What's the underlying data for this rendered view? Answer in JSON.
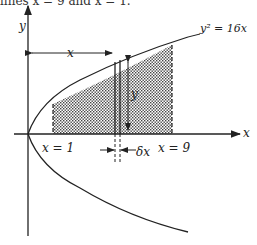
{
  "caption": "lines x = 9 and x = 1.",
  "diagram": {
    "curve_equation": "y² = 16x",
    "axis_x_label": "x",
    "axis_y_label": "y",
    "distance_label": "x",
    "height_label": "y",
    "lower_bound_label": "x = 1",
    "upper_bound_label": "x = 9",
    "strip_width_label": "δx",
    "shaded_region": "area under y² = 16x between x = 1 and x = 9"
  }
}
